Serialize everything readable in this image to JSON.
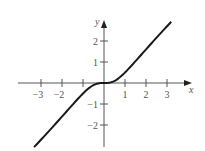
{
  "chart_data": {
    "type": "line",
    "title": "",
    "xlabel": "x",
    "ylabel": "y",
    "function": "y = x^3/(1+x^2)",
    "xlim": [
      -3.8,
      4.1
    ],
    "ylim": [
      -3.05,
      2.9
    ],
    "grid": false,
    "legend": null,
    "x_ticks": [
      -3,
      -2,
      -1,
      1,
      2,
      3
    ],
    "x_tick_labels": [
      "−3",
      "−2",
      "",
      "1",
      "2",
      "3"
    ],
    "y_ticks": [
      -2,
      -1,
      1,
      2
    ],
    "y_tick_labels": [
      "−2",
      "−1",
      "1",
      "2"
    ],
    "series": [
      {
        "name": "curve",
        "color": "#1a1a1a",
        "x": [
          -3.33,
          -3.0,
          -2.5,
          -2.0,
          -1.5,
          -1.0,
          -0.75,
          -0.5,
          -0.25,
          0,
          0.25,
          0.5,
          0.75,
          1.0,
          1.5,
          2.0,
          2.5,
          3.0,
          3.2
        ],
        "y": [
          -3.03,
          -2.7,
          -2.16,
          -1.6,
          -1.04,
          -0.5,
          -0.27,
          -0.1,
          -0.015,
          0,
          0.015,
          0.1,
          0.27,
          0.5,
          1.04,
          1.6,
          2.16,
          2.7,
          2.91
        ]
      }
    ]
  },
  "layout": {
    "origin_px": [
      104,
      83
    ],
    "unit_px": 21,
    "axis_color": "#555555"
  }
}
